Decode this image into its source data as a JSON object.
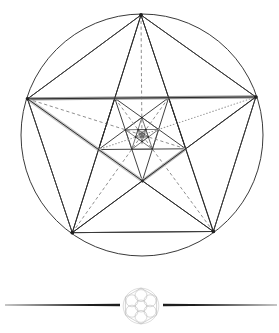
{
  "page": {
    "background_color": "#ffffff",
    "width": 279,
    "height": 333
  },
  "figure": {
    "name": "recursive-pentagram",
    "circle": {
      "center_x": 142,
      "center_y": 135,
      "radius": 121,
      "stroke": "#3a3a3a",
      "stroke_width": 1.0,
      "fill": "none"
    },
    "pentagon_vertices": [
      {
        "label": "top",
        "x": 141,
        "y": 15
      },
      {
        "label": "right",
        "x": 256,
        "y": 104
      },
      {
        "label": "bottom-right",
        "x": 212,
        "y": 242
      },
      {
        "label": "bottom-left",
        "x": 72,
        "y": 242
      },
      {
        "label": "left",
        "x": 28,
        "y": 104
      }
    ],
    "recursion_levels": 5,
    "scale_ratio": 0.381966,
    "colors": {
      "outline": "#3a3a3a",
      "pentagram": "#2b2b2b",
      "inner": "#4a4a4a",
      "highlight_strong": "#9a9a9a",
      "highlight_soft": "#c8c8c8",
      "dashed": "#7a7a7a",
      "dotted": "#9b9b9b",
      "divider": "#1e1e1e",
      "flower": "#a9a9a9"
    },
    "highlight_lines": [
      {
        "name": "horizontal-chord",
        "from": "left",
        "to": "right",
        "color": "#9a9a9a",
        "width": 3.2
      },
      {
        "name": "diagonal-chord",
        "from": "left",
        "to": "inner-bottom",
        "color": "#cfcfcf",
        "width": 3.4
      },
      {
        "name": "lower-right-edge",
        "from": "inner-bottom",
        "to": "inner-right",
        "color": "#b0b0b0",
        "width": 3.0
      }
    ],
    "dashed_lines": [
      {
        "name": "left-to-inner-right",
        "from": "left",
        "to": "inner-right"
      },
      {
        "name": "left-to-inner-mid",
        "from": "left",
        "to": "inner-mid"
      },
      {
        "name": "vertical-axis",
        "from": "top",
        "to": "center"
      },
      {
        "name": "bottomleft-to-center",
        "from": "bottom-left",
        "to": "center"
      },
      {
        "name": "bottomright-to-center",
        "from": "bottom-right",
        "to": "center"
      }
    ],
    "dotted_lines": [
      {
        "name": "right-to-inner-bottom",
        "from": "right",
        "to": "inner-bottom"
      },
      {
        "name": "right-to-inner-left",
        "from": "right",
        "to": "inner-left"
      }
    ]
  },
  "divider": {
    "name": "ornamental-divider",
    "y": 305,
    "left_rule": {
      "x1": 5,
      "x2": 120,
      "color": "#1e1e1e"
    },
    "right_rule": {
      "x1": 163,
      "x2": 277,
      "color": "#1e1e1e"
    },
    "ornament": {
      "name": "flower-of-life",
      "center_x": 141,
      "center_y": 306,
      "radius": 18,
      "circle_radius": 6,
      "color": "#a9a9a9"
    }
  }
}
